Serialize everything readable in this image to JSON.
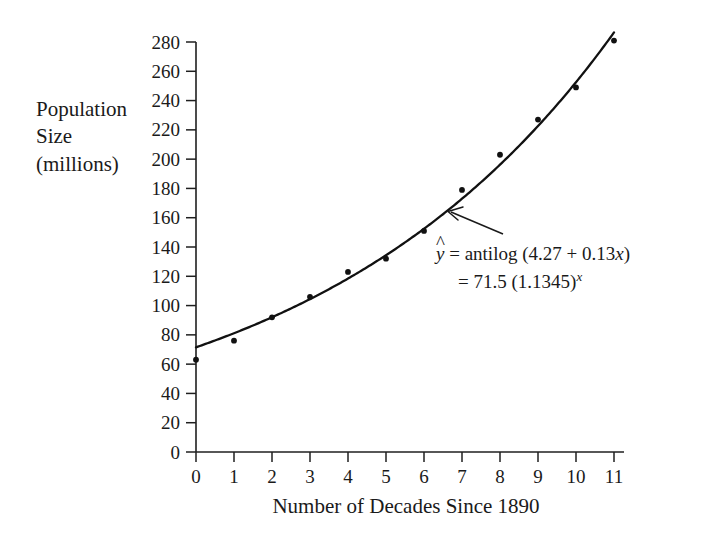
{
  "chart_data": {
    "type": "scatter",
    "title": "",
    "xlabel": "Number of Decades Since 1890",
    "ylabel": "Population\nSize\n(millions)",
    "xlim": [
      0,
      11
    ],
    "ylim": [
      0,
      290
    ],
    "grid": false,
    "legend": "none",
    "x": [
      0,
      1,
      2,
      3,
      4,
      5,
      6,
      7,
      8,
      9,
      10,
      11
    ],
    "values": [
      63,
      76,
      92,
      106,
      123,
      132,
      151,
      179,
      203,
      227,
      249,
      281
    ],
    "series": [
      {
        "name": "Observed population",
        "type": "scatter",
        "x": [
          0,
          1,
          2,
          3,
          4,
          5,
          6,
          7,
          8,
          9,
          10,
          11
        ],
        "values": [
          63,
          76,
          92,
          106,
          123,
          132,
          151,
          179,
          203,
          227,
          249,
          281
        ]
      },
      {
        "name": "Exponential fit",
        "type": "line",
        "equation_intercept": 71.5,
        "equation_base": 1.1345,
        "log_intercept": 4.27,
        "log_slope": 0.13
      }
    ],
    "xticks": [
      0,
      1,
      2,
      3,
      4,
      5,
      6,
      7,
      8,
      9,
      10,
      11
    ],
    "xtick_labels": [
      "0",
      "1",
      "2",
      "3",
      "4",
      "5",
      "6",
      "7",
      "8",
      "9",
      "10",
      "11"
    ],
    "yticks": [
      0,
      20,
      40,
      60,
      80,
      100,
      120,
      140,
      160,
      180,
      200,
      220,
      240,
      260,
      280
    ],
    "ytick_labels": [
      "0",
      "20",
      "40",
      "60",
      "80",
      "100",
      "120",
      "140",
      "160",
      "180",
      "200",
      "220",
      "240",
      "260",
      "280"
    ],
    "annotations": [
      {
        "name": "fit-equation",
        "line1_prefix": "y",
        "line1_rest": " = antilog (4.27 + 0.13",
        "line1_var": "x",
        "line1_suffix": ")",
        "line2_rest": "= 71.5 (1.1345)",
        "line2_exp": "x",
        "target_x": 6.55,
        "target_y": 165
      }
    ],
    "colors": {
      "axis": "#1f1f1f",
      "curve": "#111111",
      "points": "#111111",
      "text": "#1a1a1a",
      "background": "#ffffff"
    }
  },
  "axis_titles": {
    "y": "Population\nSize\n(millions)",
    "x": "Number of Decades Since 1890"
  },
  "equation": {
    "y_hat": "y",
    "line1": " = antilog (4.27 + 0.13",
    "line1_var": "x",
    "line1_close": ")",
    "line2": "= 71.5 (1.1345)",
    "line2_exp": "x"
  }
}
